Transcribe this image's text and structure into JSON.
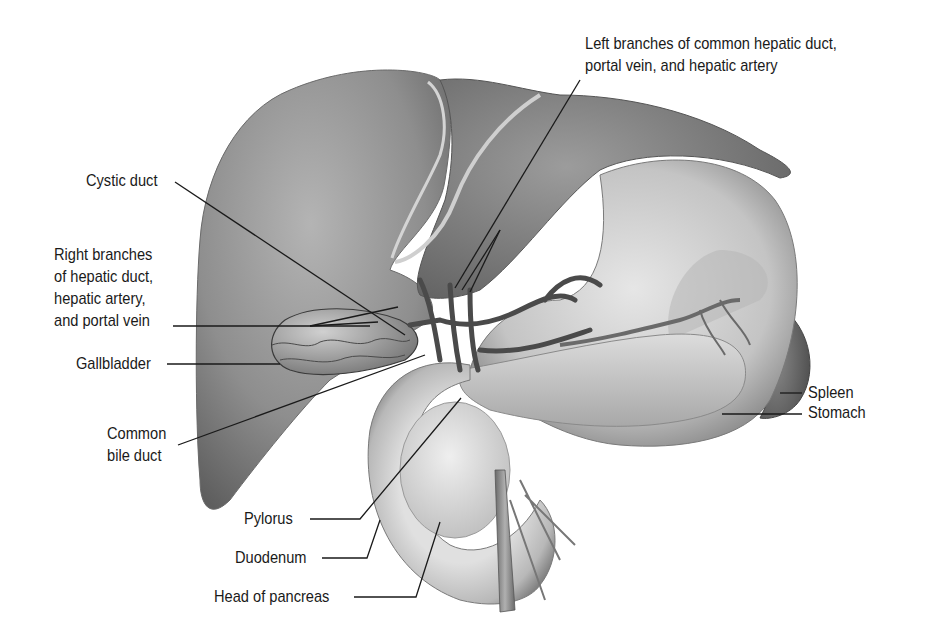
{
  "figure": {
    "type": "anatomical-illustration",
    "colors": {
      "background": "#ffffff",
      "label_text": "#1a1a1a",
      "leader_line": "#1a1a1a",
      "organ_dark": "#5a5a5a",
      "organ_mid": "#9a9a9a",
      "organ_light": "#d8d8d8"
    }
  },
  "labels": {
    "left_branches": {
      "lines": [
        "Left branches of common hepatic duct,",
        "portal vein, and hepatic artery"
      ]
    },
    "cystic_duct": {
      "text": "Cystic duct"
    },
    "right_branches": {
      "lines": [
        "Right branches",
        "of hepatic duct,",
        "hepatic artery,",
        "and portal vein"
      ]
    },
    "gallbladder": {
      "text": "Gallbladder"
    },
    "common_bile_duct": {
      "lines": [
        "Common",
        "bile duct"
      ]
    },
    "pylorus": {
      "text": "Pylorus"
    },
    "duodenum": {
      "text": "Duodenum"
    },
    "head_of_pancreas": {
      "text": "Head of pancreas"
    },
    "spleen": {
      "text": "Spleen"
    },
    "stomach": {
      "text": "Stomach"
    }
  }
}
